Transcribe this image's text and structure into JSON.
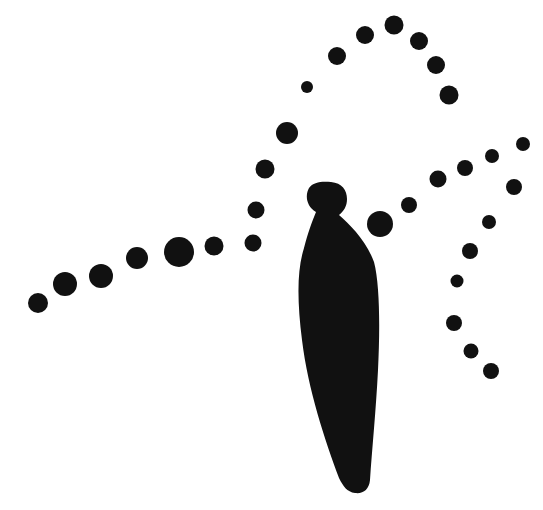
{
  "illustration": {
    "background": "#ffffff",
    "ink": "#111111",
    "figure": {
      "path": "M 316 212 C 306 206 305 195 309 188 C 313 182 322 181 331 182 C 342 183 347 190 347 199 C 347 206 344 211 339 215 C 350 225 366 240 374 262 C 380 285 380 330 378 370 C 376 410 372 450 370 480 C 369 490 363 494 355 493 C 347 492 343 486 339 478 C 325 440 308 390 302 340 C 297 300 297 270 304 248 C 308 232 312 222 316 212 Z"
    },
    "dots": [
      {
        "x": 38,
        "y": 303,
        "r": 10
      },
      {
        "x": 65,
        "y": 284,
        "r": 12
      },
      {
        "x": 101,
        "y": 276,
        "r": 12
      },
      {
        "x": 137,
        "y": 258,
        "r": 11
      },
      {
        "x": 179,
        "y": 252,
        "r": 15
      },
      {
        "x": 214,
        "y": 246,
        "r": 9.5
      },
      {
        "x": 253,
        "y": 243,
        "r": 8.5
      },
      {
        "x": 256,
        "y": 210,
        "r": 8.5
      },
      {
        "x": 265,
        "y": 169,
        "r": 9.5
      },
      {
        "x": 287,
        "y": 133,
        "r": 11
      },
      {
        "x": 307,
        "y": 87,
        "r": 6
      },
      {
        "x": 337,
        "y": 56,
        "r": 9
      },
      {
        "x": 365,
        "y": 35,
        "r": 9
      },
      {
        "x": 394,
        "y": 25,
        "r": 9.5
      },
      {
        "x": 419,
        "y": 41,
        "r": 9
      },
      {
        "x": 436,
        "y": 65,
        "r": 9
      },
      {
        "x": 449,
        "y": 95,
        "r": 9.5
      },
      {
        "x": 380,
        "y": 224,
        "r": 13
      },
      {
        "x": 409,
        "y": 205,
        "r": 8
      },
      {
        "x": 438,
        "y": 179,
        "r": 8.5
      },
      {
        "x": 465,
        "y": 168,
        "r": 8
      },
      {
        "x": 492,
        "y": 156,
        "r": 7
      },
      {
        "x": 523,
        "y": 144,
        "r": 7
      },
      {
        "x": 514,
        "y": 187,
        "r": 8
      },
      {
        "x": 489,
        "y": 222,
        "r": 7
      },
      {
        "x": 470,
        "y": 251,
        "r": 8
      },
      {
        "x": 457,
        "y": 281,
        "r": 6.5
      },
      {
        "x": 454,
        "y": 323,
        "r": 8
      },
      {
        "x": 471,
        "y": 351,
        "r": 7.5
      },
      {
        "x": 491,
        "y": 371,
        "r": 8
      }
    ]
  }
}
